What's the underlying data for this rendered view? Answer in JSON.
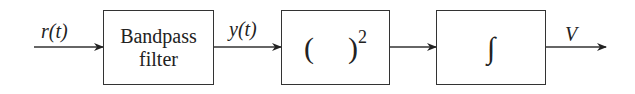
{
  "diagram": {
    "type": "block-diagram",
    "input_signal": "r(t)",
    "blocks": [
      {
        "id": "bandpass",
        "line1": "Bandpass",
        "line2": "filter"
      },
      {
        "id": "square",
        "open": "(",
        "close": ")",
        "exponent": "2"
      },
      {
        "id": "integrator",
        "symbol": "∫"
      }
    ],
    "intermediate_signal": "y(t)",
    "output_signal": "V",
    "colors": {
      "stroke": "#333333",
      "background": "#ffffff"
    }
  }
}
